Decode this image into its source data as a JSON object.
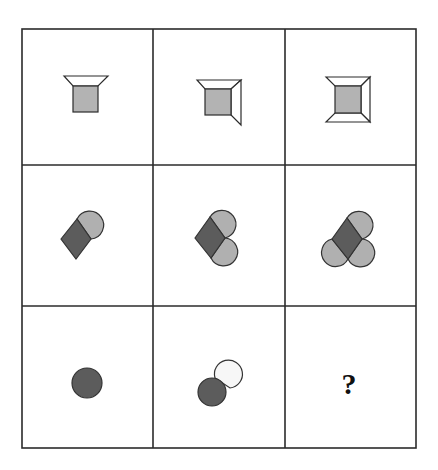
{
  "puzzle": {
    "type": "3x3 matrix reasoning puzzle",
    "grid": {
      "rows": 3,
      "cols": 3,
      "line_color": "#2b2b2b",
      "background": "#ffffff"
    },
    "colors": {
      "square_fill": "#b3b3b3",
      "frame_fill": "#ffffff",
      "dark_fill": "#5c5c5c",
      "light_fill": "#b0b0b0",
      "white_fill": "#f7f7f7",
      "outline": "#333333"
    },
    "cells": [
      {
        "row": 1,
        "col": 1,
        "description": "gray square with one trapezoid panel on top"
      },
      {
        "row": 1,
        "col": 2,
        "description": "gray square with trapezoid panels on top and right"
      },
      {
        "row": 1,
        "col": 3,
        "description": "gray square with trapezoid panels on top, right and bottom"
      },
      {
        "row": 2,
        "col": 1,
        "description": "dark diamond with one light half-disc attached upper-right"
      },
      {
        "row": 2,
        "col": 2,
        "description": "dark diamond with two light half-discs attached upper-right and lower-right"
      },
      {
        "row": 2,
        "col": 3,
        "description": "dark diamond with three light half-discs attached upper-right, lower-right and lower-left"
      },
      {
        "row": 3,
        "col": 1,
        "description": "dark circle"
      },
      {
        "row": 3,
        "col": 2,
        "description": "dark circle with one white half-disc attached upper-right"
      },
      {
        "row": 3,
        "col": 3,
        "description": "unknown answer cell"
      }
    ],
    "answer_placeholder": "?"
  }
}
